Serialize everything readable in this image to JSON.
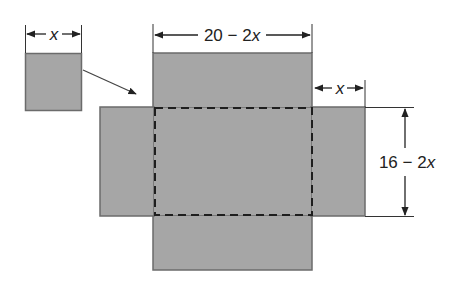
{
  "diagram": {
    "colors": {
      "fill": "#a6a6a6",
      "stroke": "#6b6b6b",
      "line": "#333333",
      "background": "#ffffff"
    },
    "labels": {
      "corner_square_width": {
        "text": "x"
      },
      "base_width": {
        "prefix": "20 − 2",
        "var": "x"
      },
      "flap_width": {
        "text": "x"
      },
      "base_height": {
        "prefix": "16 − 2",
        "var": "x"
      }
    },
    "shapes": {
      "corner_square": {
        "x": 25,
        "y": 53,
        "w": 56,
        "h": 57
      },
      "top_flap": {
        "x": 153,
        "y": 53,
        "w": 159,
        "h": 54
      },
      "left_flap": {
        "x": 100,
        "y": 107,
        "w": 53,
        "h": 109
      },
      "right_flap": {
        "x": 312,
        "y": 107,
        "w": 53,
        "h": 109
      },
      "bottom_flap": {
        "x": 153,
        "y": 216,
        "w": 159,
        "h": 54
      },
      "base": {
        "x": 153,
        "y": 107,
        "w": 159,
        "h": 109
      }
    }
  }
}
